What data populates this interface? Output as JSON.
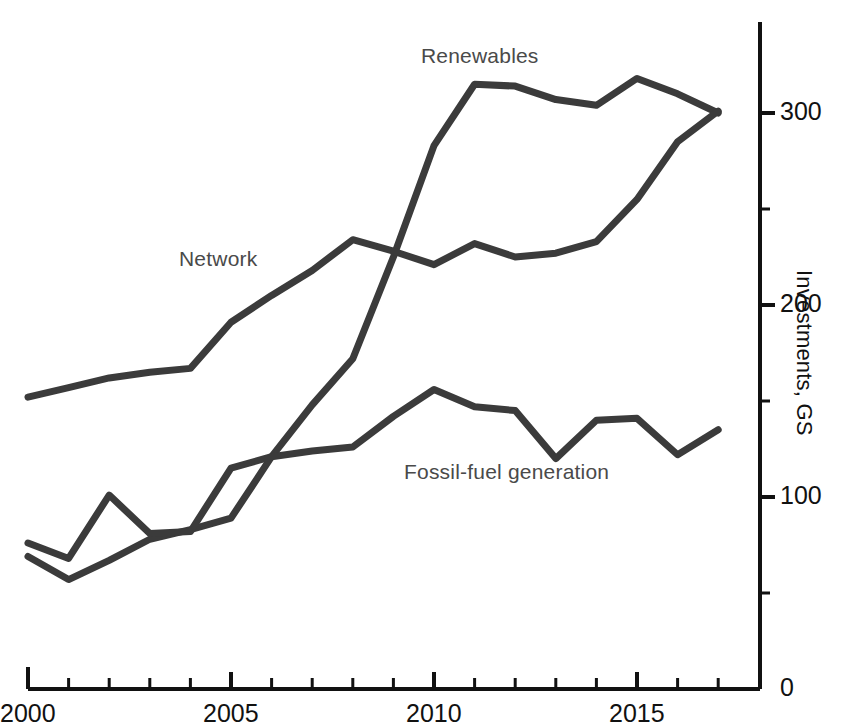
{
  "chart_data": {
    "type": "line",
    "title": "",
    "subtitle": "",
    "xlabel": "",
    "ylabel": "Investments, G$",
    "ylabel_rendered": "Investments, GS",
    "x": [
      2000,
      2001,
      2002,
      2003,
      2004,
      2005,
      2006,
      2007,
      2008,
      2009,
      2010,
      2011,
      2012,
      2013,
      2014,
      2015,
      2016,
      2017
    ],
    "xlim": [
      2000,
      2017.8
    ],
    "ylim": [
      0,
      345
    ],
    "grid": false,
    "legend_position": "inline-annotations",
    "x_tick_labels": [
      "2000",
      "2005",
      "2010",
      "2015"
    ],
    "x_tick_values": [
      2000,
      2005,
      2010,
      2015
    ],
    "x_minor_tick_values": [
      2001,
      2002,
      2003,
      2004,
      2006,
      2007,
      2008,
      2009,
      2011,
      2012,
      2013,
      2014,
      2016,
      2017
    ],
    "y_tick_labels": [
      "0",
      "100",
      "200",
      "300"
    ],
    "y_tick_values": [
      0,
      100,
      200,
      300
    ],
    "y_minor_tick_values": [
      50,
      150,
      250
    ],
    "y_axis_side": "right",
    "line_color": "#3b3b3b",
    "axis_color": "#111111",
    "series": [
      {
        "name": "Renewables",
        "label_x": 2010.3,
        "values": [
          69,
          57,
          67,
          78,
          83,
          89,
          121,
          148,
          172,
          225,
          283,
          315,
          314,
          307,
          304,
          318,
          310,
          300
        ]
      },
      {
        "name": "Network",
        "label_x": 2003.7,
        "values": [
          152,
          157,
          162,
          165,
          167,
          191,
          205,
          218,
          234,
          228,
          221,
          232,
          225,
          227,
          233,
          255,
          285,
          301
        ]
      },
      {
        "name": "Fossil-fuel generation",
        "label_x": 2009.3,
        "values": [
          76,
          68,
          101,
          81,
          82,
          115,
          121,
          124,
          126,
          142,
          156,
          147,
          145,
          120,
          140,
          141,
          122,
          135
        ]
      }
    ]
  },
  "labels": {
    "renewables": "Renewables",
    "network": "Network",
    "fossil": "Fossil-fuel generation"
  },
  "axis": {
    "y_title": "Investments, GS",
    "x_2000": "2000",
    "x_2005": "2005",
    "x_2010": "2010",
    "x_2015": "2015",
    "y_0": "0",
    "y_100": "100",
    "y_200": "200",
    "y_300": "300"
  }
}
